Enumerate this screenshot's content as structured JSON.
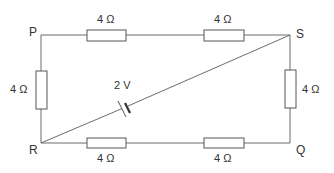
{
  "diagram": {
    "type": "circuit",
    "nodes": {
      "P": "P",
      "S": "S",
      "R": "R",
      "Q": "Q"
    },
    "resistors": [
      {
        "id": "PS-left",
        "branch": "P-S",
        "label": "4 Ω"
      },
      {
        "id": "PS-right",
        "branch": "P-S",
        "label": "4 Ω"
      },
      {
        "id": "PR",
        "branch": "P-R",
        "label": "4 Ω"
      },
      {
        "id": "SQ",
        "branch": "S-Q",
        "label": "4 Ω"
      },
      {
        "id": "RQ-left",
        "branch": "R-Q",
        "label": "4 Ω"
      },
      {
        "id": "RQ-right",
        "branch": "R-Q",
        "label": "4 Ω"
      }
    ],
    "cell": {
      "branch": "R-S",
      "label": "2 V"
    },
    "colors": {
      "wire": "#6b6b6b",
      "text": "#333333",
      "background": "#ffffff"
    }
  }
}
